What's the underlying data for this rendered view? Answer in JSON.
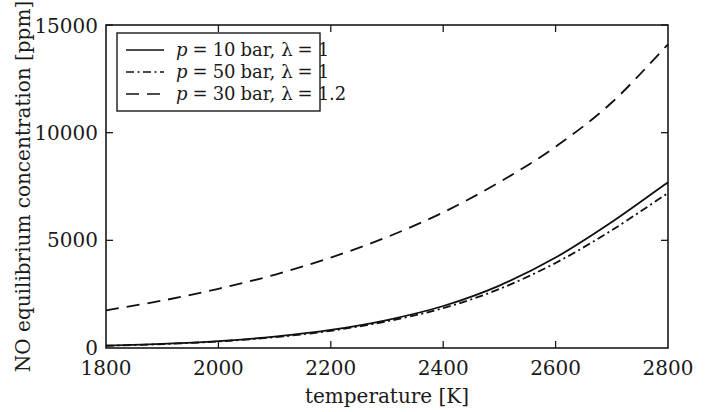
{
  "chart_data": {
    "type": "line",
    "title": "",
    "xlabel": "temperature [K]",
    "ylabel": "NO equilibrium concentration [ppm]",
    "xlim": [
      1800,
      2800
    ],
    "ylim": [
      0,
      15000
    ],
    "xticks": [
      1800,
      2000,
      2200,
      2400,
      2600,
      2800
    ],
    "xtick_labels": [
      "1800",
      "2000",
      "2200",
      "2400",
      "2600",
      "2800"
    ],
    "yticks": [
      0,
      5000,
      10000,
      15000
    ],
    "ytick_labels": [
      "0",
      "5000",
      "10000",
      "15000"
    ],
    "grid": false,
    "legend_position": "upper left",
    "x": [
      1800,
      1900,
      2000,
      2100,
      2200,
      2300,
      2400,
      2500,
      2600,
      2700,
      2800
    ],
    "series": [
      {
        "name": "p = 10 bar, lambda = 1",
        "label": "p = 10 bar, λ = 1",
        "linestyle": "solid",
        "color": "#101010",
        "values": [
          110,
          190,
          320,
          530,
          840,
          1300,
          1950,
          2900,
          4200,
          5850,
          7700
        ]
      },
      {
        "name": "p = 50 bar, lambda = 1",
        "label": "p = 50 bar, λ = 1",
        "linestyle": "dashdot",
        "color": "#101010",
        "values": [
          105,
          180,
          305,
          500,
          800,
          1240,
          1850,
          2740,
          3950,
          5470,
          7200
        ]
      },
      {
        "name": "p = 30 bar, lambda = 1.2",
        "label": "p = 30 bar, λ = 1.2",
        "linestyle": "dashed",
        "color": "#101010",
        "values": [
          1750,
          2200,
          2750,
          3400,
          4200,
          5150,
          6300,
          7700,
          9350,
          11400,
          14100
        ]
      }
    ]
  },
  "legend": {
    "entries": [
      {
        "symbol": "p",
        "eq1": "=",
        "pressure": "10",
        "unit": "bar,",
        "lambda": "λ",
        "eq2": "=",
        "lambda_value": "1",
        "style": "solid"
      },
      {
        "symbol": "p",
        "eq1": "=",
        "pressure": "50",
        "unit": "bar,",
        "lambda": "λ",
        "eq2": "=",
        "lambda_value": "1",
        "style": "dashdot"
      },
      {
        "symbol": "p",
        "eq1": "=",
        "pressure": "30",
        "unit": "bar,",
        "lambda": "λ",
        "eq2": "=",
        "lambda_value": "1.2",
        "style": "dashed"
      }
    ]
  },
  "axes": {
    "x_title": "temperature [K]",
    "y_title": "NO equilibrium concentration [ppm]",
    "x_tick_0": "1800",
    "x_tick_1": "2000",
    "x_tick_2": "2200",
    "x_tick_3": "2400",
    "x_tick_4": "2600",
    "x_tick_5": "2800",
    "y_tick_0": "0",
    "y_tick_1": "5000",
    "y_tick_2": "10000",
    "y_tick_3": "15000"
  },
  "style": {
    "axis_color": "#1a1a1a",
    "line_color": "#101010",
    "background": "#ffffff"
  }
}
